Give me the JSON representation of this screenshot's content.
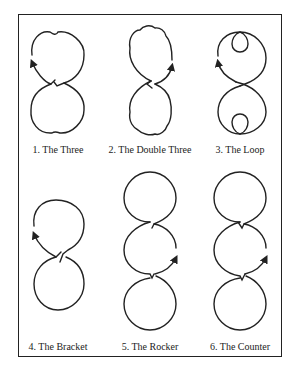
{
  "figure": {
    "title": "",
    "stroke_color": "#222222",
    "background": "#ffffff",
    "figures": [
      {
        "number": "1.",
        "label": "1.  The Three"
      },
      {
        "number": "2.",
        "label": "2.  The Double Three"
      },
      {
        "number": "3.",
        "label": "3.  The Loop"
      },
      {
        "number": "4.",
        "label": "4.  The Bracket"
      },
      {
        "number": "5.",
        "label": "5.  The Rocker"
      },
      {
        "number": "6.",
        "label": "6.  The Counter"
      }
    ]
  }
}
